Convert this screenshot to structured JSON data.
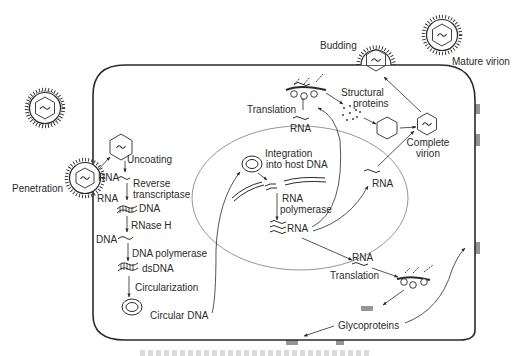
{
  "diagram": {
    "colors": {
      "ink": "#2a2a2a",
      "nucleus": "#777777",
      "background": "#ffffff"
    },
    "labels": {
      "penetration": "Penetration",
      "uncoating": "Uncoating",
      "rna_1": "RNA",
      "rna_2": "RNA",
      "reverse": "Reverse",
      "transcriptase": "transcriptase",
      "dna_1": "DNA",
      "rnase_h": "RNase H",
      "dna_2": "DNA",
      "dna_polymerase": "DNA polymerase",
      "dsdna": "dsDNA",
      "circularization": "Circularization",
      "circular_dna": "Circular DNA",
      "integration_1": "Integration",
      "integration_2": "into host DNA",
      "rna_polymerase_1": "RNA",
      "rna_polymerase_2": "polymerase",
      "rna_nucleus": "RNA",
      "translation_top": "Translation",
      "rna_top": "RNA",
      "structural_1": "Structural",
      "structural_2": "proteins",
      "rna_mid": "RNA",
      "complete_1": "Complete",
      "complete_2": "virion",
      "budding": "Budding",
      "mature_virion": "Mature virion",
      "rna_lower": "RNA",
      "translation_lower": "Translation",
      "glycoproteins": "Glycoproteins"
    },
    "caption": ""
  }
}
